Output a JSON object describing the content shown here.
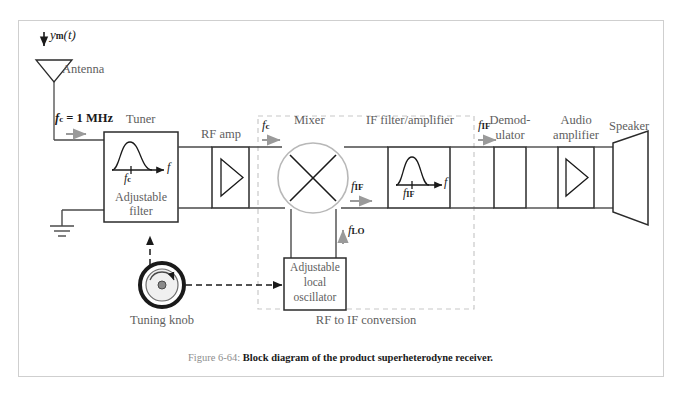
{
  "figure": {
    "number": "Figure 6-64:",
    "caption": "Block diagram of the product superheterodyne receiver."
  },
  "signals": {
    "input": "ym(t)",
    "input_base": "y",
    "input_sub": "m",
    "input_arg": "(t)",
    "carrier_value": "fc = 1 MHz",
    "carrier_sym": "f",
    "carrier_sub": "c",
    "carrier_eq": " = 1 MHz",
    "fc": "fc",
    "fif": "fIF",
    "flo": "fLO",
    "freq_axis": "f"
  },
  "blocks": [
    {
      "id": "antenna",
      "label": "Antenna",
      "shape": "antenna-triangle"
    },
    {
      "id": "tuner",
      "label": "Tuner",
      "inner_line1": "Adjustable",
      "inner_line2": "filter",
      "shape": "rect-with-bandpass-curve"
    },
    {
      "id": "rf_amp",
      "label": "RF amp",
      "shape": "rect-with-triangle-amp"
    },
    {
      "id": "mixer",
      "label": "Mixer",
      "shape": "circle-with-x"
    },
    {
      "id": "if_filter",
      "label": "IF filter/amplifier",
      "shape": "rect-with-bandpass-curve"
    },
    {
      "id": "demodulator",
      "label_line1": "Demod-",
      "label_line2": "ulator",
      "shape": "plain-rect"
    },
    {
      "id": "audio_amp",
      "label_line1": "Audio",
      "label_line2": "amplifier",
      "shape": "rect-with-triangle-amp"
    },
    {
      "id": "speaker",
      "label": "Speaker",
      "shape": "trapezoid"
    },
    {
      "id": "local_osc",
      "inner_line1": "Adjustable",
      "inner_line2": "local",
      "inner_line3": "oscillator",
      "shape": "plain-rect"
    },
    {
      "id": "tuning_knob",
      "label": "Tuning knob",
      "shape": "knob-circle"
    },
    {
      "id": "ground",
      "label": "",
      "shape": "ground-symbol"
    }
  ],
  "groups": [
    {
      "id": "rf_to_if",
      "label": "RF to IF conversion",
      "style": "dashed-boundary"
    }
  ],
  "colors": {
    "frame_border": "#cfcfcf",
    "line": "#4a4a4a",
    "block_stroke": "#2b2b2b",
    "label_text": "#5e5e5e",
    "dark_text": "#1a1a1a",
    "mixer_stroke": "#b8b8b8",
    "dashed_boundary": "#c8c8c8",
    "arrow_gray": "#8d8d8d",
    "background": "#ffffff"
  },
  "curve_labels": {
    "tuner_peak_mark": "fc",
    "tuner_axis": "f",
    "if_peak_mark": "fIF",
    "if_axis": "f"
  }
}
